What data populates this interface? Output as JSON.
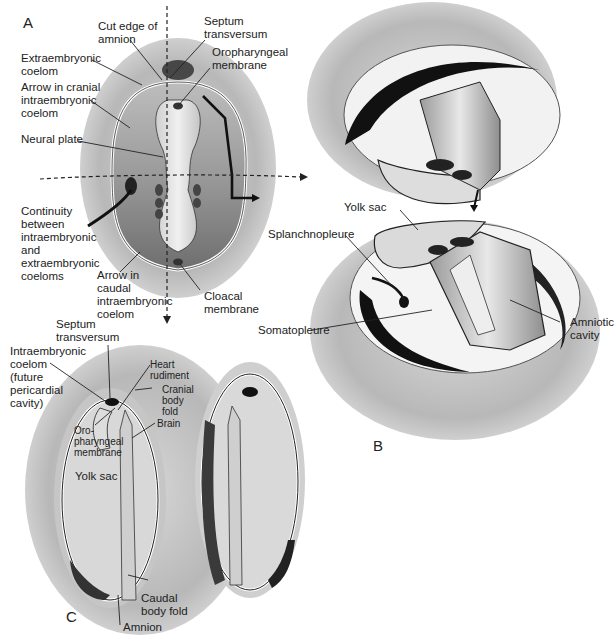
{
  "panels": {
    "a": "A",
    "b": "B",
    "c": "C"
  },
  "panel_a": {
    "labels": {
      "cut_edge_amnion": "Cut edge of\namnion",
      "septum_transversum": "Septum\ntransversum",
      "extraembryonic_coelom": "Extraembryonic\ncoelom",
      "oropharyngeal_membrane": "Oropharyngeal\nmembrane",
      "arrow_cranial": "Arrow in cranial\nintraembryonic\ncoelom",
      "neural_plate": "Neural plate",
      "continuity": "Continuity\nbetween\nintraembryonic\nand\nextraembryonic\ncoeloms",
      "arrow_caudal": "Arrow in\ncaudal\nintraembryonic\ncoelom",
      "cloacal_membrane": "Cloacal\nmembrane"
    }
  },
  "panel_b": {
    "labels": {
      "yolk_sac": "Yolk sac",
      "splanchnopleure": "Splanchnopleure",
      "somatopleure": "Somatopleure",
      "amniotic_cavity": "Amniotic\ncavity"
    }
  },
  "panel_c": {
    "labels": {
      "septum_transversum": "Septum\ntransversum",
      "intraembryonic_coelom": "Intraembryonic\ncoelom\n(future\npericardial\ncavity)",
      "heart_rudiment": "Heart\nrudiment",
      "cranial_body_fold": "Cranial\nbody\nfold",
      "oropharyngeal_membrane": "Oro-\npharyngeal\nmembrane",
      "brain": "Brain",
      "yolk_sac": "Yolk sac",
      "caudal_body_fold": "Caudal\nbody fold",
      "amnion": "Amnion"
    }
  },
  "colors": {
    "text": "#222222",
    "ectoderm_halo": "#c8c8c8",
    "dark_tissue": "#1a1a1a",
    "mid_gray": "#8a8a8a",
    "light_gray": "#e2e2e2"
  }
}
